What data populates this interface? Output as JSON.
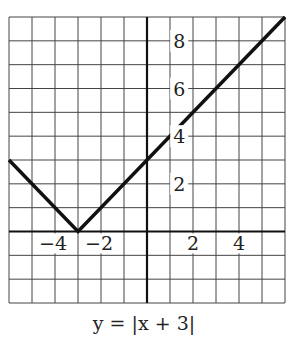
{
  "chart_data": {
    "type": "line",
    "title": "",
    "caption": "y = |x + 3|",
    "xlabel": "",
    "ylabel": "",
    "xlim": [
      -6,
      6
    ],
    "ylim": [
      -3,
      9
    ],
    "grid": true,
    "x_ticks": [
      {
        "value": -4,
        "label": "−4"
      },
      {
        "value": -2,
        "label": "−2"
      },
      {
        "value": 2,
        "label": "2"
      },
      {
        "value": 4,
        "label": "4"
      }
    ],
    "y_ticks": [
      {
        "value": 2,
        "label": "2"
      },
      {
        "value": 4,
        "label": "4"
      },
      {
        "value": 6,
        "label": "6"
      },
      {
        "value": 8,
        "label": "8"
      }
    ],
    "series": [
      {
        "name": "y = |x + 3|",
        "x": [
          -6,
          -3,
          6
        ],
        "y": [
          3,
          0,
          9
        ],
        "color": "#111111"
      }
    ]
  },
  "colors": {
    "grid": "#444444",
    "axis": "#111111",
    "line": "#111111",
    "background": "#ffffff"
  }
}
